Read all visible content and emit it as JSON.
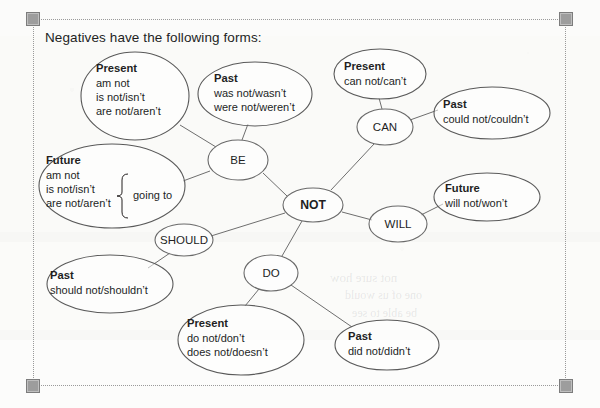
{
  "document": {
    "title_text": "Negatives have the following forms:"
  },
  "selection": {
    "handles": [
      "top-left",
      "top-right",
      "bottom-left",
      "bottom-right"
    ],
    "frame_style": "dotted"
  },
  "diagram": {
    "type": "mind-map",
    "center": {
      "id": "not",
      "label": "NOT",
      "bold": true,
      "cx": 313,
      "cy": 205,
      "rx": 30,
      "ry": 17
    },
    "hubs": [
      {
        "id": "be",
        "label": "BE",
        "cx": 238,
        "cy": 160,
        "rx": 30,
        "ry": 20
      },
      {
        "id": "can",
        "label": "CAN",
        "cx": 385,
        "cy": 127,
        "rx": 28,
        "ry": 18
      },
      {
        "id": "will",
        "label": "WILL",
        "cx": 398,
        "cy": 224,
        "rx": 29,
        "ry": 18
      },
      {
        "id": "should",
        "label": "SHOULD",
        "cx": 184,
        "cy": 240,
        "rx": 29,
        "ry": 16
      },
      {
        "id": "do",
        "label": "DO",
        "cx": 271,
        "cy": 273,
        "rx": 27,
        "ry": 18
      }
    ],
    "leaves": [
      {
        "id": "be-present",
        "parent": "be",
        "cx": 135,
        "cy": 96,
        "rx": 54,
        "ry": 44,
        "heading": "Present",
        "lines": [
          "am not",
          "is not/isn’t",
          "are not/aren’t"
        ],
        "text_x": 96,
        "text_y": 72
      },
      {
        "id": "be-past",
        "parent": "be",
        "cx": 255,
        "cy": 94,
        "rx": 57,
        "ry": 32,
        "heading": "Past",
        "lines": [
          "was not/wasn’t",
          "were not/weren’t"
        ],
        "text_x": 214,
        "text_y": 82
      },
      {
        "id": "be-future",
        "parent": "be",
        "cx": 112,
        "cy": 186,
        "rx": 73,
        "ry": 42,
        "heading": "Future",
        "lines": [
          "am not",
          "is not/isn’t",
          "are not/aren’t"
        ],
        "text_x": 46,
        "text_y": 164,
        "brace_label": "going to"
      },
      {
        "id": "can-present",
        "parent": "can",
        "cx": 380,
        "cy": 74,
        "rx": 46,
        "ry": 25,
        "heading": "Present",
        "lines": [
          "can not/can’t"
        ],
        "text_x": 344,
        "text_y": 70
      },
      {
        "id": "can-past",
        "parent": "can",
        "cx": 492,
        "cy": 113,
        "rx": 58,
        "ry": 26,
        "heading": "Past",
        "lines": [
          "could not/couldn’t"
        ],
        "text_x": 443,
        "text_y": 108
      },
      {
        "id": "will-future",
        "parent": "will",
        "cx": 487,
        "cy": 197,
        "rx": 53,
        "ry": 24,
        "heading": "Future",
        "lines": [
          "will not/won’t"
        ],
        "text_x": 445,
        "text_y": 192
      },
      {
        "id": "should-past",
        "parent": "should",
        "cx": 110,
        "cy": 284,
        "rx": 63,
        "ry": 29,
        "heading": "Past",
        "lines": [
          "should not/shouldn’t"
        ],
        "text_x": 50,
        "text_y": 279
      },
      {
        "id": "do-present",
        "parent": "do",
        "cx": 241,
        "cy": 340,
        "rx": 63,
        "ry": 35,
        "heading": "Present",
        "lines": [
          "do not/don’t",
          "does not/doesn’t"
        ],
        "text_x": 187,
        "text_y": 327
      },
      {
        "id": "do-past",
        "parent": "do",
        "cx": 387,
        "cy": 345,
        "rx": 52,
        "ry": 25,
        "heading": "Past",
        "lines": [
          "did not/didn’t"
        ],
        "text_x": 348,
        "text_y": 340
      }
    ],
    "edges": [
      {
        "from": "not",
        "to": "be",
        "x1": 287,
        "y1": 196,
        "x2": 263,
        "y2": 173
      },
      {
        "from": "not",
        "to": "can",
        "x1": 331,
        "y1": 190,
        "x2": 374,
        "y2": 144
      },
      {
        "from": "not",
        "to": "will",
        "x1": 342,
        "y1": 212,
        "x2": 372,
        "y2": 220
      },
      {
        "from": "not",
        "to": "should",
        "x1": 285,
        "y1": 213,
        "x2": 211,
        "y2": 236
      },
      {
        "from": "not",
        "to": "do",
        "x1": 302,
        "y1": 221,
        "x2": 282,
        "y2": 256
      },
      {
        "from": "be",
        "to": "be-present",
        "x1": 216,
        "y1": 147,
        "x2": 180,
        "y2": 125
      },
      {
        "from": "be",
        "to": "be-past",
        "x1": 242,
        "y1": 140,
        "x2": 248,
        "y2": 124
      },
      {
        "from": "be",
        "to": "be-future",
        "x1": 210,
        "y1": 171,
        "x2": 183,
        "y2": 181
      },
      {
        "from": "can",
        "to": "can-present",
        "x1": 382,
        "y1": 109,
        "x2": 379,
        "y2": 98
      },
      {
        "from": "can",
        "to": "can-past",
        "x1": 410,
        "y1": 120,
        "x2": 438,
        "y2": 110
      },
      {
        "from": "will",
        "to": "will-future",
        "x1": 421,
        "y1": 215,
        "x2": 443,
        "y2": 204
      },
      {
        "from": "should",
        "to": "should-past",
        "x1": 170,
        "y1": 253,
        "x2": 148,
        "y2": 268
      },
      {
        "from": "do",
        "to": "do-present",
        "x1": 259,
        "y1": 289,
        "x2": 245,
        "y2": 306
      },
      {
        "from": "do",
        "to": "do-past",
        "x1": 291,
        "y1": 285,
        "x2": 352,
        "y2": 327
      }
    ]
  }
}
